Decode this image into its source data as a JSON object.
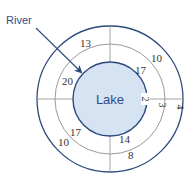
{
  "diagram": {
    "center_label": "Lake",
    "pointer_label": "River",
    "colors": {
      "lake_fill": "#d6e3f3",
      "lake_stroke": "#2c4a7c",
      "outer_ring_stroke": "#2c4a7c",
      "middle_ring_stroke": "#9a9a9a",
      "grid_line": "#9a9a9a",
      "label_text": "#2e4e8a",
      "value_text": "#333333",
      "arrow": "#2c4a7c"
    },
    "rings": {
      "inner_label": "2",
      "middle_label": "3",
      "outer_label": "4"
    },
    "values": {
      "top_left_outer": "13",
      "top_left_inner": "20",
      "top_right_outer": "10",
      "top_right_inner": "17",
      "bottom_left_outer": "10",
      "bottom_left_inner": "17",
      "bottom_right_outer": "8",
      "bottom_right_inner": "14"
    }
  }
}
